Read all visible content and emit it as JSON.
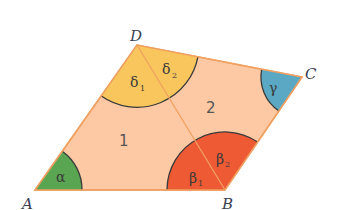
{
  "vertices": {
    "A": {
      "label": "A"
    },
    "B": {
      "label": "B"
    },
    "C": {
      "label": "C"
    },
    "D": {
      "label": "D"
    }
  },
  "regions": {
    "triangle_1": {
      "label": "1"
    },
    "triangle_2": {
      "label": "2"
    }
  },
  "angles": {
    "alpha": {
      "symbol": "α",
      "color": "#5aa552"
    },
    "beta_1": {
      "symbol": "β",
      "sub": "1",
      "color": "#ee5a34"
    },
    "beta_2": {
      "symbol": "β",
      "sub": "2",
      "color": "#ee5a34"
    },
    "gamma": {
      "symbol": "γ",
      "color": "#5aa8c4"
    },
    "delta_1": {
      "symbol": "δ",
      "sub": "1",
      "color": "#f8c65c"
    },
    "delta_2": {
      "symbol": "δ",
      "sub": "2",
      "color": "#f8c65c"
    }
  },
  "colors": {
    "fill": "#fcc9a4",
    "edge": "#f0a060",
    "arc": "#3a3a3a"
  }
}
